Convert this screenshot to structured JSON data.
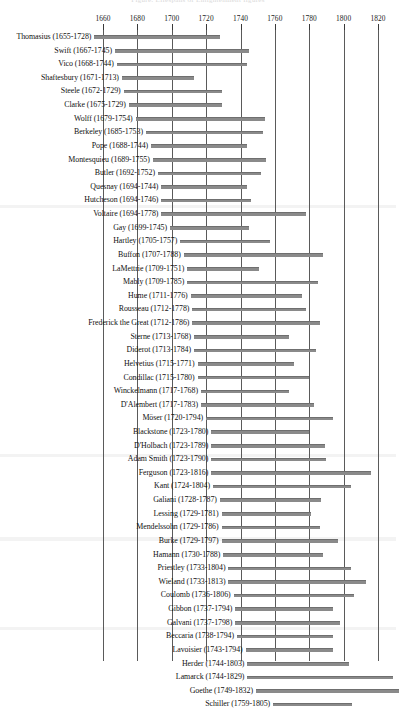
{
  "caption": "Figure: Lifespans of Enlightenment figures",
  "chart_data": {
    "type": "bar",
    "orientation": "horizontal",
    "title": "",
    "subtitle": "",
    "xlabel": "",
    "ylabel": "",
    "xlim": [
      1645,
      1838
    ],
    "grid": true,
    "gridlines_vertical": true,
    "legend": "none",
    "bar_color": "#8a8a8a",
    "axis_color": "#5a5a5a",
    "tick_labels": [
      "1660",
      "1680",
      "1700",
      "1720",
      "1740",
      "1760",
      "1780",
      "1800",
      "1820"
    ],
    "tick_values": [
      1660,
      1680,
      1700,
      1720,
      1740,
      1760,
      1780,
      1800,
      1820
    ],
    "categories": [
      "Thomasius (1655-1728)",
      "Swift (1667-1745)",
      "Vico (1668-1744)",
      "Shaftesbury (1671-1713)",
      "Steele (1672-1729)",
      "Clarke (1675-1729)",
      "Wolff (1679-1754)",
      "Berkeley (1685-1753)",
      "Pope (1688-1744)",
      "Montesquieu (1689-1755)",
      "Butler (1692-1752)",
      "Quesnay (1694-1744)",
      "Hutcheson (1694-1746)",
      "Voltaire (1694-1778)",
      "Gay (1699-1745)",
      "Hartley (1705-1757)",
      "Buffon (1707-1788)",
      "LaMettrie (1709-1751)",
      "Mably (1709-1785)",
      "Hume (1711-1776)",
      "Rousseau (1712-1778)",
      "Frederick the Great (1712-1786)",
      "Sterne (1713-1768)",
      "Diderot (1713-1784)",
      "Helvetius (1715-1771)",
      "Condillac (1715-1780)",
      "Winckelmann (1717-1768)",
      "D'Alembert (1717-1783)",
      "Möser (1720-1794)",
      "Blackstone (1723-1780)",
      "D'Holbach (1723-1789)",
      "Adam Smith (1723-1790)",
      "Ferguson (1723-1816)",
      "Kant (1724-1804)",
      "Galiani (1728-1787)",
      "Lessing (1729-1781)",
      "Mendelssohn (1729-1786)",
      "Burke (1729-1797)",
      "Hamann (1730-1788)",
      "Priestley (1733-1804)",
      "Wieland (1733-1813)",
      "Coulomb (1736-1806)",
      "Gibbon (1737-1794)",
      "Galvani (1737-1798)",
      "Beccaria (1738-1794)",
      "Lavoisier (1743-1794)",
      "Herder (1744-1803)",
      "Lamarck (1744-1829)",
      "Goethe (1749-1832)",
      "Schiller (1759-1805)"
    ],
    "spans": [
      {
        "name": "Thomasius",
        "birth": 1655,
        "death": 1728
      },
      {
        "name": "Swift",
        "birth": 1667,
        "death": 1745
      },
      {
        "name": "Vico",
        "birth": 1668,
        "death": 1744
      },
      {
        "name": "Shaftesbury",
        "birth": 1671,
        "death": 1713
      },
      {
        "name": "Steele",
        "birth": 1672,
        "death": 1729
      },
      {
        "name": "Clarke",
        "birth": 1675,
        "death": 1729
      },
      {
        "name": "Wolff",
        "birth": 1679,
        "death": 1754
      },
      {
        "name": "Berkeley",
        "birth": 1685,
        "death": 1753
      },
      {
        "name": "Pope",
        "birth": 1688,
        "death": 1744
      },
      {
        "name": "Montesquieu",
        "birth": 1689,
        "death": 1755
      },
      {
        "name": "Butler",
        "birth": 1692,
        "death": 1752
      },
      {
        "name": "Quesnay",
        "birth": 1694,
        "death": 1744
      },
      {
        "name": "Hutcheson",
        "birth": 1694,
        "death": 1746
      },
      {
        "name": "Voltaire",
        "birth": 1694,
        "death": 1778
      },
      {
        "name": "Gay",
        "birth": 1699,
        "death": 1745
      },
      {
        "name": "Hartley",
        "birth": 1705,
        "death": 1757
      },
      {
        "name": "Buffon",
        "birth": 1707,
        "death": 1788
      },
      {
        "name": "LaMettrie",
        "birth": 1709,
        "death": 1751
      },
      {
        "name": "Mably",
        "birth": 1709,
        "death": 1785
      },
      {
        "name": "Hume",
        "birth": 1711,
        "death": 1776
      },
      {
        "name": "Rousseau",
        "birth": 1712,
        "death": 1778
      },
      {
        "name": "Frederick the Great",
        "birth": 1712,
        "death": 1786
      },
      {
        "name": "Sterne",
        "birth": 1713,
        "death": 1768
      },
      {
        "name": "Diderot",
        "birth": 1713,
        "death": 1784
      },
      {
        "name": "Helvetius",
        "birth": 1715,
        "death": 1771
      },
      {
        "name": "Condillac",
        "birth": 1715,
        "death": 1780
      },
      {
        "name": "Winckelmann",
        "birth": 1717,
        "death": 1768
      },
      {
        "name": "D'Alembert",
        "birth": 1717,
        "death": 1783
      },
      {
        "name": "Möser",
        "birth": 1720,
        "death": 1794
      },
      {
        "name": "Blackstone",
        "birth": 1723,
        "death": 1780
      },
      {
        "name": "D'Holbach",
        "birth": 1723,
        "death": 1789
      },
      {
        "name": "Adam Smith",
        "birth": 1723,
        "death": 1790
      },
      {
        "name": "Ferguson",
        "birth": 1723,
        "death": 1816
      },
      {
        "name": "Kant",
        "birth": 1724,
        "death": 1804
      },
      {
        "name": "Galiani",
        "birth": 1728,
        "death": 1787
      },
      {
        "name": "Lessing",
        "birth": 1729,
        "death": 1781
      },
      {
        "name": "Mendelssohn",
        "birth": 1729,
        "death": 1786
      },
      {
        "name": "Burke",
        "birth": 1729,
        "death": 1797
      },
      {
        "name": "Hamann",
        "birth": 1730,
        "death": 1788
      },
      {
        "name": "Priestley",
        "birth": 1733,
        "death": 1804
      },
      {
        "name": "Wieland",
        "birth": 1733,
        "death": 1813
      },
      {
        "name": "Coulomb",
        "birth": 1736,
        "death": 1806
      },
      {
        "name": "Gibbon",
        "birth": 1737,
        "death": 1794
      },
      {
        "name": "Galvani",
        "birth": 1737,
        "death": 1798
      },
      {
        "name": "Beccaria",
        "birth": 1738,
        "death": 1794
      },
      {
        "name": "Lavoisier",
        "birth": 1743,
        "death": 1794
      },
      {
        "name": "Herder",
        "birth": 1744,
        "death": 1803
      },
      {
        "name": "Lamarck",
        "birth": 1744,
        "death": 1829
      },
      {
        "name": "Goethe",
        "birth": 1749,
        "death": 1832
      },
      {
        "name": "Schiller",
        "birth": 1759,
        "death": 1805
      }
    ]
  }
}
